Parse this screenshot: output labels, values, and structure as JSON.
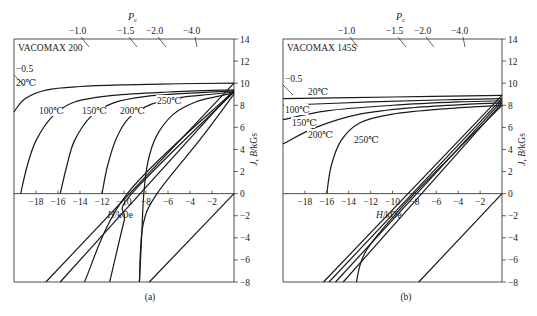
{
  "chart_data": [
    {
      "type": "line",
      "panel": "a",
      "caption": "(a)",
      "title": "VACOMAX 200",
      "xlabel": "H/kOe",
      "ylabel": "J, B/kGs",
      "top_axis_label": "Pc",
      "top_axis_ticks": [
        "-0.5",
        "-1.0",
        "-1.5",
        "-2.0",
        "-4.0"
      ],
      "xlim": [
        -20,
        0
      ],
      "ylim": [
        -8,
        14
      ],
      "x_ticks": [
        "-18",
        "-16",
        "-14",
        "-12",
        "-10",
        "-8",
        "-6",
        "-4",
        "-2"
      ],
      "y_ticks": [
        "14",
        "12",
        "10",
        "8",
        "6",
        "4",
        "2",
        "0",
        "-2",
        "-4",
        "-6",
        "-8"
      ],
      "series": [
        {
          "name": "20℃ J",
          "points": [
            [
              -20,
              7.4
            ],
            [
              -19,
              8.6
            ],
            [
              -17,
              9.4
            ],
            [
              -14,
              9.7
            ],
            [
              -10,
              9.85
            ],
            [
              -5,
              9.95
            ],
            [
              0,
              10.0
            ]
          ]
        },
        {
          "name": "100℃ J",
          "points": [
            [
              -19.4,
              0
            ],
            [
              -18.8,
              2.5
            ],
            [
              -18,
              4.8
            ],
            [
              -16.5,
              7.0
            ],
            [
              -14.5,
              8.3
            ],
            [
              -11,
              8.9
            ],
            [
              -6,
              9.2
            ],
            [
              0,
              9.4
            ]
          ]
        },
        {
          "name": "150℃ J",
          "points": [
            [
              -15.8,
              0
            ],
            [
              -15.2,
              2.5
            ],
            [
              -14.5,
              4.8
            ],
            [
              -13,
              7.0
            ],
            [
              -11,
              8.2
            ],
            [
              -8,
              8.8
            ],
            [
              -4,
              9.1
            ],
            [
              0,
              9.3
            ]
          ]
        },
        {
          "name": "200℃ J",
          "points": [
            [
              -12,
              0
            ],
            [
              -11.5,
              2.5
            ],
            [
              -10.7,
              5.0
            ],
            [
              -9.5,
              6.9
            ],
            [
              -7.5,
              8.1
            ],
            [
              -5,
              8.7
            ],
            [
              -2,
              9.0
            ],
            [
              0,
              9.2
            ]
          ]
        },
        {
          "name": "250℃ J",
          "points": [
            [
              -8.6,
              -8
            ],
            [
              -8.4,
              -4
            ],
            [
              -8.2,
              0
            ],
            [
              -7.8,
              3.0
            ],
            [
              -7,
              5.3
            ],
            [
              -5.5,
              7.2
            ],
            [
              -3.5,
              8.3
            ],
            [
              -1.5,
              8.8
            ],
            [
              0,
              9.1
            ]
          ]
        },
        {
          "name": "20℃ B",
          "points": [
            [
              -17.1,
              -8
            ],
            [
              0,
              10.0
            ]
          ]
        },
        {
          "name": "100℃ B",
          "points": [
            [
              -15.8,
              -8
            ],
            [
              0,
              9.4
            ]
          ]
        },
        {
          "name": "150℃ B",
          "points": [
            [
              -13.6,
              -8
            ],
            [
              -9.7,
              0
            ],
            [
              0,
              9.3
            ]
          ]
        },
        {
          "name": "200℃ B",
          "points": [
            [
              -11.3,
              -8
            ],
            [
              -10,
              -2.5
            ],
            [
              -9.3,
              0
            ],
            [
              0,
              9.2
            ]
          ]
        },
        {
          "name": "250℃ B",
          "points": [
            [
              -8.6,
              -8
            ],
            [
              -8.3,
              -3
            ],
            [
              -7,
              0
            ],
            [
              -3,
              5
            ],
            [
              0,
              9.0
            ]
          ]
        },
        {
          "name": "load line Pc",
          "points": [
            [
              -7.7,
              -8
            ],
            [
              0,
              0
            ]
          ]
        }
      ]
    },
    {
      "type": "line",
      "panel": "b",
      "caption": "(b)",
      "title": "VACOMAX 145S",
      "xlabel": "H/kOe",
      "ylabel": "J, B/kGs",
      "top_axis_label": "Pc",
      "top_axis_ticks": [
        "-0.5",
        "-1.0",
        "-1.5",
        "-2.0",
        "-4.0"
      ],
      "xlim": [
        -20,
        0
      ],
      "ylim": [
        -8,
        14
      ],
      "x_ticks": [
        "-18",
        "-16",
        "-14",
        "-12",
        "-10",
        "-8",
        "-6",
        "-4",
        "-2"
      ],
      "y_ticks": [
        "14",
        "12",
        "10",
        "8",
        "6",
        "4",
        "2",
        "0",
        "-2",
        "-4",
        "-6",
        "-8"
      ],
      "series": [
        {
          "name": "20℃ J",
          "points": [
            [
              -20,
              8.6
            ],
            [
              -10,
              8.75
            ],
            [
              0,
              8.9
            ]
          ]
        },
        {
          "name": "100℃ J",
          "points": [
            [
              -20,
              8.0
            ],
            [
              -12,
              8.3
            ],
            [
              -5,
              8.5
            ],
            [
              0,
              8.6
            ]
          ]
        },
        {
          "name": "150℃ J",
          "points": [
            [
              -20,
              6.7
            ],
            [
              -16,
              7.5
            ],
            [
              -10,
              8.0
            ],
            [
              -4,
              8.3
            ],
            [
              0,
              8.4
            ]
          ]
        },
        {
          "name": "200℃ J",
          "points": [
            [
              -20,
              4.5
            ],
            [
              -17,
              6.0
            ],
            [
              -13,
              7.2
            ],
            [
              -8,
              7.8
            ],
            [
              -3,
              8.1
            ],
            [
              0,
              8.2
            ]
          ]
        },
        {
          "name": "250℃ J",
          "points": [
            [
              -16,
              0
            ],
            [
              -15.6,
              2.5
            ],
            [
              -14.7,
              4.8
            ],
            [
              -13,
              6.4
            ],
            [
              -10,
              7.2
            ],
            [
              -5,
              7.7
            ],
            [
              0,
              8.0
            ]
          ]
        },
        {
          "name": "20℃ B",
          "points": [
            [
              -16.3,
              -8
            ],
            [
              0,
              8.9
            ]
          ]
        },
        {
          "name": "100℃ B",
          "points": [
            [
              -15.8,
              -8
            ],
            [
              0,
              8.6
            ]
          ]
        },
        {
          "name": "150℃ B",
          "points": [
            [
              -15.2,
              -8
            ],
            [
              0,
              8.4
            ]
          ]
        },
        {
          "name": "200℃ B",
          "points": [
            [
              -14.5,
              -8
            ],
            [
              0,
              8.2
            ]
          ]
        },
        {
          "name": "250℃ B",
          "points": [
            [
              -13.3,
              -8
            ],
            [
              -12.3,
              -5
            ],
            [
              -8.0,
              0
            ],
            [
              0,
              8.0
            ]
          ]
        },
        {
          "name": "load line Pc",
          "points": [
            [
              -7.6,
              -8
            ],
            [
              0,
              0
            ]
          ]
        }
      ]
    }
  ],
  "panels": [
    {
      "caption": "(a)",
      "title": "VACOMAX 200",
      "xlabel": "H/kOe",
      "ylabel": "J, B/kGs",
      "pc_label": "P",
      "pc_sub": "c",
      "temp_labels": [
        {
          "text": "20℃",
          "x": 16,
          "y": 86
        },
        {
          "text": "100℃",
          "x": 39,
          "y": 114
        },
        {
          "text": "150℃",
          "x": 82,
          "y": 114
        },
        {
          "text": "200℃",
          "x": 120,
          "y": 114
        },
        {
          "text": "250℃",
          "x": 157,
          "y": 104
        }
      ],
      "pc_ticks": [
        {
          "text": "-0.5",
          "tx": 16,
          "ty": 72
        },
        {
          "text": "-1.0",
          "tx": 69,
          "ty": 34
        },
        {
          "text": "-1.5",
          "tx": 117,
          "ty": 34
        },
        {
          "text": "-2.0",
          "tx": 146,
          "ty": 34
        },
        {
          "text": "-4.0",
          "tx": 183,
          "ty": 34
        }
      ]
    },
    {
      "caption": "(b)",
      "title": "VACOMAX 145S",
      "xlabel": "H/kOe",
      "ylabel": "J, B/kGs",
      "pc_label": "P",
      "pc_sub": "c",
      "temp_labels": [
        {
          "text": "20℃",
          "x": 308,
          "y": 95
        },
        {
          "text": "100℃",
          "x": 285,
          "y": 113
        },
        {
          "text": "150℃",
          "x": 292,
          "y": 126
        },
        {
          "text": "200℃",
          "x": 308,
          "y": 138
        },
        {
          "text": "250℃",
          "x": 354,
          "y": 143
        }
      ],
      "pc_ticks": [
        {
          "text": "-0.5",
          "tx": 285,
          "ty": 82
        },
        {
          "text": "-1.0",
          "tx": 338,
          "ty": 34
        },
        {
          "text": "-1.5",
          "tx": 386,
          "ty": 34
        },
        {
          "text": "-2.0",
          "tx": 414,
          "ty": 34
        },
        {
          "text": "-4.0",
          "tx": 451,
          "ty": 34
        }
      ]
    }
  ]
}
